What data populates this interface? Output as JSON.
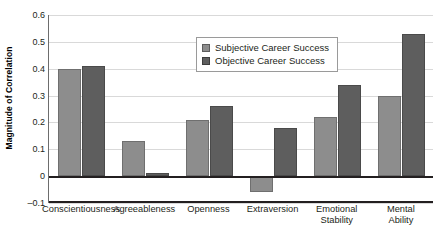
{
  "chart_data": {
    "type": "bar",
    "title": "",
    "xlabel": "",
    "ylabel": "Magnitude of Correlation",
    "ylim": [
      -0.1,
      0.6
    ],
    "ytick_labels": [
      "0.6",
      "0.5",
      "0.4",
      "0.3",
      "0.2",
      "0.1",
      "0",
      "-0.1"
    ],
    "ytick_values": [
      0.6,
      0.5,
      0.4,
      0.3,
      0.2,
      0.1,
      0,
      -0.1
    ],
    "grid": true,
    "legend_position": "top-center",
    "categories": [
      "Conscientiousness",
      "Agreeableness",
      "Openness",
      "Extraversion",
      "Emotional Stability",
      "Mental Ability"
    ],
    "category_labels": [
      [
        "Conscientiousness"
      ],
      [
        "Agreeableness"
      ],
      [
        "Openness"
      ],
      [
        "Extraversion"
      ],
      [
        "Emotional",
        "Stability"
      ],
      [
        "Mental",
        "Ability"
      ]
    ],
    "series": [
      {
        "name": "Subjective Career Success",
        "color": "#8d8d8d",
        "values": [
          0.4,
          0.13,
          0.21,
          -0.06,
          0.22,
          0.3
        ]
      },
      {
        "name": "Objective Career Success",
        "color": "#5e5e5e",
        "values": [
          0.41,
          0.01,
          0.26,
          0.18,
          0.34,
          0.53
        ]
      }
    ]
  },
  "legend": {
    "items": [
      {
        "label": "Subjective Career Success",
        "swatch": "subjective"
      },
      {
        "label": "Objective Career Success",
        "swatch": "objective"
      }
    ]
  }
}
